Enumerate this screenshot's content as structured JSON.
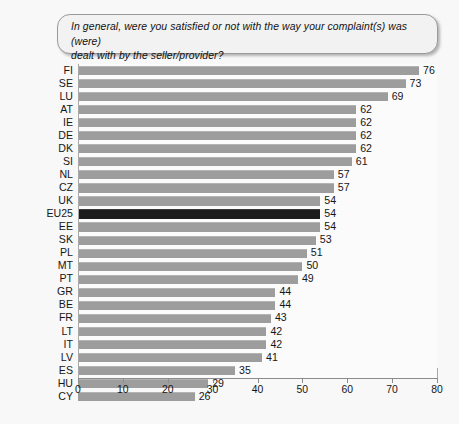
{
  "question": {
    "text": "In general, were you satisfied or not with the way your complaint(s) was (were)\ndealt with by the seller/provider?"
  },
  "footer": {
    "note": ""
  },
  "colors": {
    "bar": "#9d9d9d",
    "highlight_bar": "#1c1c1c",
    "background": "#f8f8f8",
    "box_fill": "#f2f2f2",
    "box_border": "#9a9a9a",
    "axis": "#8c8c8c",
    "text": "#161616"
  },
  "chart_data": {
    "type": "bar",
    "orientation": "horizontal",
    "title": "In general, were you satisfied or not with the way your complaint(s) was (were) dealt with by the seller/provider?",
    "xlabel": "",
    "ylabel": "",
    "xlim": [
      0,
      80
    ],
    "xticks": [
      0,
      10,
      20,
      30,
      40,
      50,
      60,
      70,
      80
    ],
    "grid": false,
    "legend": false,
    "highlight_category": "EU25",
    "categories": [
      "FI",
      "SE",
      "LU",
      "AT",
      "IE",
      "DE",
      "DK",
      "SI",
      "NL",
      "CZ",
      "UK",
      "EU25",
      "EE",
      "SK",
      "PL",
      "MT",
      "PT",
      "GR",
      "BE",
      "FR",
      "LT",
      "IT",
      "LV",
      "ES",
      "HU",
      "CY"
    ],
    "values": [
      76,
      73,
      69,
      62,
      62,
      62,
      62,
      61,
      57,
      57,
      54,
      54,
      54,
      53,
      51,
      50,
      49,
      44,
      44,
      43,
      42,
      42,
      41,
      35,
      29,
      26
    ],
    "bars": [
      {
        "label": "FI",
        "value": 76,
        "highlight": false
      },
      {
        "label": "SE",
        "value": 73,
        "highlight": false
      },
      {
        "label": "LU",
        "value": 69,
        "highlight": false
      },
      {
        "label": "AT",
        "value": 62,
        "highlight": false
      },
      {
        "label": "IE",
        "value": 62,
        "highlight": false
      },
      {
        "label": "DE",
        "value": 62,
        "highlight": false
      },
      {
        "label": "DK",
        "value": 62,
        "highlight": false
      },
      {
        "label": "SI",
        "value": 61,
        "highlight": false
      },
      {
        "label": "NL",
        "value": 57,
        "highlight": false
      },
      {
        "label": "CZ",
        "value": 57,
        "highlight": false
      },
      {
        "label": "UK",
        "value": 54,
        "highlight": false
      },
      {
        "label": "EU25",
        "value": 54,
        "highlight": true
      },
      {
        "label": "EE",
        "value": 54,
        "highlight": false
      },
      {
        "label": "SK",
        "value": 53,
        "highlight": false
      },
      {
        "label": "PL",
        "value": 51,
        "highlight": false
      },
      {
        "label": "MT",
        "value": 50,
        "highlight": false
      },
      {
        "label": "PT",
        "value": 49,
        "highlight": false
      },
      {
        "label": "GR",
        "value": 44,
        "highlight": false
      },
      {
        "label": "BE",
        "value": 44,
        "highlight": false
      },
      {
        "label": "FR",
        "value": 43,
        "highlight": false
      },
      {
        "label": "LT",
        "value": 42,
        "highlight": false
      },
      {
        "label": "IT",
        "value": 42,
        "highlight": false
      },
      {
        "label": "LV",
        "value": 41,
        "highlight": false
      },
      {
        "label": "ES",
        "value": 35,
        "highlight": false
      },
      {
        "label": "HU",
        "value": 29,
        "highlight": false
      },
      {
        "label": "CY",
        "value": 26,
        "highlight": false
      }
    ]
  }
}
